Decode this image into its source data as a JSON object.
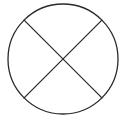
{
  "diagram": {
    "type": "crossed-circle",
    "stroke_color": "#2a2a2a",
    "background_color": "#ffffff",
    "elements": [
      {
        "kind": "circle",
        "name": "outer-circle"
      },
      {
        "kind": "line",
        "name": "diagonal-line-top-left-to-bottom-right",
        "from_angle_deg": 225,
        "to_angle_deg": 45
      },
      {
        "kind": "line",
        "name": "diagonal-line-top-right-to-bottom-left",
        "from_angle_deg": 315,
        "to_angle_deg": 135
      }
    ]
  }
}
